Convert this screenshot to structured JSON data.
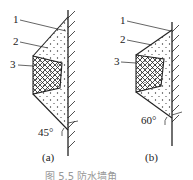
{
  "figure": {
    "caption": "图 5.5  防水墙角",
    "panels": [
      {
        "id": "a",
        "label": "(a)",
        "angle_label": "45°",
        "slope_angle_deg": 45,
        "callouts": [
          {
            "number": "1"
          },
          {
            "number": "2"
          },
          {
            "number": "3"
          }
        ]
      },
      {
        "id": "b",
        "label": "(b)",
        "angle_label": "60°",
        "slope_angle_deg": 60,
        "callouts": [
          {
            "number": "1"
          },
          {
            "number": "2"
          },
          {
            "number": "3"
          }
        ]
      }
    ]
  },
  "legend_items": [
    {
      "number": "1",
      "meaning": "wall"
    },
    {
      "number": "2",
      "meaning": "dotted fill"
    },
    {
      "number": "3",
      "meaning": "crosshatched block"
    }
  ],
  "colors": {
    "ink": "#222222",
    "background": "#ffffff"
  }
}
